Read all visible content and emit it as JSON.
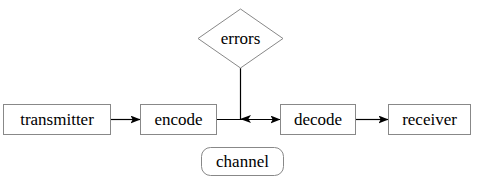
{
  "diagram": {
    "width": 477,
    "height": 184,
    "background_color": "#ffffff",
    "stroke_color": "#808080",
    "line_color": "#000000",
    "text_color": "#000000",
    "nodes": [
      {
        "id": "transmitter",
        "label": "transmitter",
        "shape": "rectangle",
        "x": 3,
        "y": 104,
        "width": 108,
        "height": 31
      },
      {
        "id": "encode",
        "label": "encode",
        "shape": "rectangle",
        "x": 140,
        "y": 104,
        "width": 77,
        "height": 31
      },
      {
        "id": "decode",
        "label": "decode",
        "shape": "rectangle",
        "x": 280,
        "y": 104,
        "width": 76,
        "height": 31
      },
      {
        "id": "receiver",
        "label": "receiver",
        "shape": "rectangle",
        "x": 388,
        "y": 104,
        "width": 83,
        "height": 31
      },
      {
        "id": "errors",
        "label": "errors",
        "shape": "diamond",
        "x": 198,
        "y": 9,
        "width": 85,
        "height": 59
      },
      {
        "id": "channel",
        "label": "channel",
        "shape": "rounded-rectangle",
        "x": 201,
        "y": 147,
        "width": 83,
        "height": 29
      }
    ],
    "edges": [
      {
        "id": "transmitter-to-encode",
        "from": "transmitter",
        "to": "encode",
        "arrowhead": true,
        "direction": "right"
      },
      {
        "id": "encode-to-decode",
        "from": "encode",
        "to": "decode",
        "arrowhead": true,
        "direction": "right"
      },
      {
        "id": "decode-to-receiver",
        "from": "decode",
        "to": "receiver",
        "arrowhead": true,
        "direction": "right"
      },
      {
        "id": "errors-to-channel-line",
        "from": "errors",
        "to": "encode-to-decode",
        "arrowhead": true,
        "direction": "down"
      }
    ]
  }
}
